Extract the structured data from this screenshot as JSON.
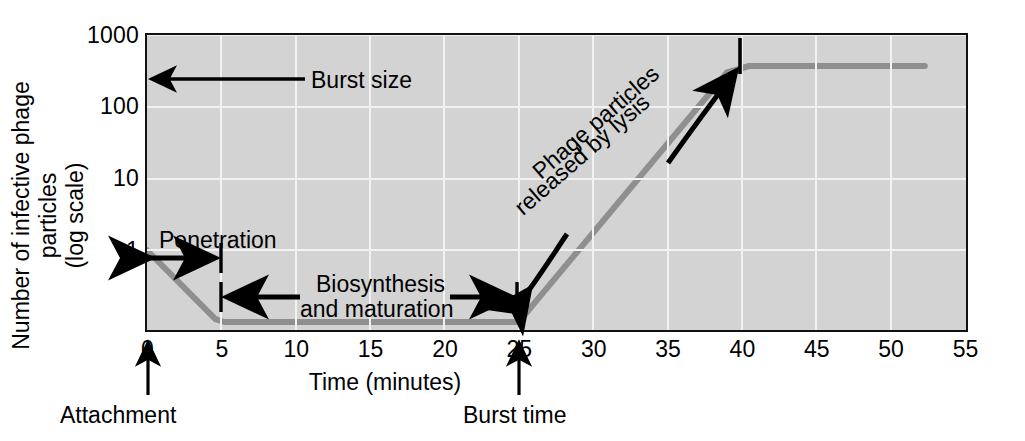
{
  "chart_data": {
    "type": "line",
    "title": "",
    "xlabel": "Time (minutes)",
    "ylabel_line1": "Number of infective phage particles",
    "ylabel_line2": "(log scale)",
    "yscale": "log",
    "xlim": [
      0,
      55
    ],
    "ylim": [
      0.08,
      1000
    ],
    "xticks": [
      "0",
      "5",
      "10",
      "15",
      "20",
      "25",
      "30",
      "35",
      "40",
      "45",
      "50",
      "55"
    ],
    "xtick_values": [
      0,
      5,
      10,
      15,
      20,
      25,
      30,
      35,
      40,
      45,
      50,
      55
    ],
    "yticks": [
      "1000",
      "100",
      "10",
      "1"
    ],
    "ytick_values": [
      1000,
      100,
      10,
      1
    ],
    "grid": true,
    "legend": "none",
    "series": [
      {
        "name": "Infective phage particles",
        "color": "#8f8f8f",
        "points": [
          {
            "x": 0,
            "y": 1.0
          },
          {
            "x": 4.6,
            "y": 0.11
          },
          {
            "x": 5.2,
            "y": 0.1
          },
          {
            "x": 25.0,
            "y": 0.1
          },
          {
            "x": 26.2,
            "y": 0.2
          },
          {
            "x": 39.0,
            "y": 300
          },
          {
            "x": 40.5,
            "y": 370
          },
          {
            "x": 52.3,
            "y": 370
          }
        ]
      }
    ],
    "annotations": [
      {
        "name": "burst-size",
        "text": "Burst size",
        "x": 4.0,
        "y": 370,
        "arrow": "left-to-axis"
      },
      {
        "name": "penetration",
        "text": "Penetration",
        "x_start": 0,
        "x_end": 5,
        "y": 1.0,
        "arrow": "double-horizontal"
      },
      {
        "name": "biosynthesis",
        "text": "Biosynthesis and maturation",
        "line1": "Biosynthesis",
        "line2": "and maturation",
        "x_start": 5,
        "x_end": 25,
        "arrow": "double-horizontal"
      },
      {
        "name": "lysis",
        "line1": "Phage particles",
        "line2": "released by lysis",
        "x_start": 25.5,
        "x_end": 39.5,
        "arrow": "double-curved-diagonal",
        "rotation_deg": -41
      }
    ],
    "axis_callouts": [
      {
        "name": "attachment",
        "text": "Attachment",
        "x": 0
      },
      {
        "name": "burst-time",
        "text": "Burst time",
        "x": 25
      }
    ],
    "colors": {
      "plot_background": "#d3d3d3",
      "gridline": "#f2f2f2",
      "curve": "#8f8f8f",
      "axis": "#111111",
      "text": "#000000",
      "page_background": "#ffffff"
    }
  }
}
